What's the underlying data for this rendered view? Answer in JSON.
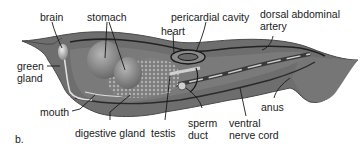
{
  "figure": {
    "panel_label": "b.",
    "colors": {
      "body": "#6e6e6e",
      "body_dark": "#4a4a4a",
      "organ_light": "#9a9a9a",
      "highlight": "#d9d9d9",
      "line": "#1a1a1a",
      "background": "#ffffff"
    },
    "labels": [
      {
        "id": "brain",
        "text": "brain"
      },
      {
        "id": "stomach",
        "text": "stomach"
      },
      {
        "id": "pericardial-cavity",
        "text": "pericardial cavity"
      },
      {
        "id": "heart",
        "text": "heart"
      },
      {
        "id": "dorsal-abdominal-artery",
        "text": "dorsal abdominal\nartery"
      },
      {
        "id": "green-gland",
        "text": "green\ngland"
      },
      {
        "id": "mouth",
        "text": "mouth"
      },
      {
        "id": "digestive-gland",
        "text": "digestive gland"
      },
      {
        "id": "testis",
        "text": "testis"
      },
      {
        "id": "sperm-duct",
        "text": "sperm\nduct"
      },
      {
        "id": "ventral-nerve-cord",
        "text": "ventral\nnerve cord"
      },
      {
        "id": "anus",
        "text": "anus"
      }
    ]
  }
}
